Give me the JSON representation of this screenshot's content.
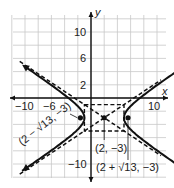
{
  "chart_data": {
    "type": "line",
    "title": "",
    "equation": "(x-2)^2/9 - (y+3)^2/4 = 1",
    "xlabel": "x",
    "ylabel": "y",
    "xlim": [
      -12,
      11
    ],
    "ylim": [
      -12,
      12
    ],
    "grid": true,
    "grid_step": 2,
    "x_tick_labels": [
      "-10",
      "-6",
      "10"
    ],
    "y_tick_labels": [
      "10",
      "6",
      "2",
      "-10"
    ],
    "center": {
      "x": 2,
      "y": -3,
      "label": "(2, -3)"
    },
    "foci": [
      {
        "x": -1.606,
        "y": -3,
        "label": "(2 − √13, −3)"
      },
      {
        "x": 5.606,
        "y": -3,
        "label": "(2 + √13, −3)"
      }
    ],
    "vertices": [
      {
        "x": -1,
        "y": -3
      },
      {
        "x": 5,
        "y": -3
      }
    ],
    "asymptotes": [
      {
        "slope": 0.6667,
        "through": [
          2,
          -3
        ],
        "style": "dashed"
      },
      {
        "slope": -0.6667,
        "through": [
          2,
          -3
        ],
        "style": "dashed"
      }
    ],
    "central_rectangle": {
      "x_range": [
        -1,
        5
      ],
      "y_range": [
        -5,
        -1
      ],
      "style": "dashed"
    },
    "series": [
      {
        "name": "left branch",
        "style": "solid"
      },
      {
        "name": "right branch",
        "style": "solid"
      }
    ]
  },
  "labels": {
    "x_axis": "x",
    "y_axis": "y",
    "tick_x_neg10": "−10",
    "tick_x_neg6": "−6",
    "tick_x_10": "10",
    "tick_y_10": "10",
    "tick_y_6": "6",
    "tick_y_2": "2",
    "tick_y_neg10": "−10",
    "center": "(2, −3)",
    "focus_left": "(2 − √13, −3)",
    "focus_right": "(2 + √13, −3)"
  }
}
